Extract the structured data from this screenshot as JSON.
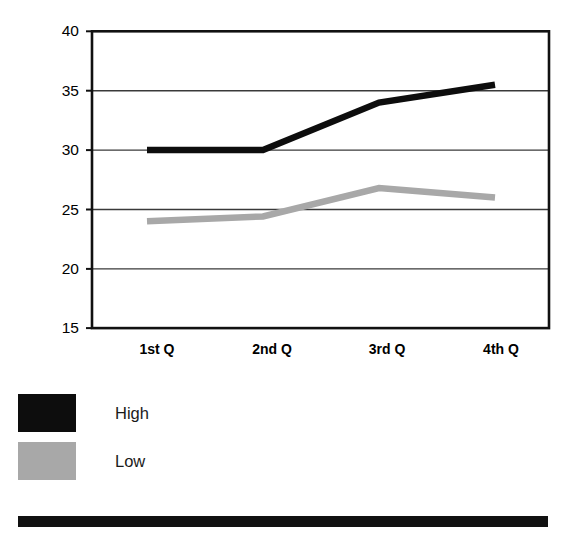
{
  "chart_data": {
    "type": "line",
    "title": "",
    "subtitle": "",
    "xlabel": "",
    "ylabel": "",
    "categories": [
      "1st Q",
      "2nd Q",
      "3rd Q",
      "4th Q"
    ],
    "series": [
      {
        "name": "High",
        "color": "#0d0d0d",
        "values": [
          30,
          30,
          34,
          35.5
        ]
      },
      {
        "name": "Low",
        "color": "#a8a8a8",
        "values": [
          24,
          24.4,
          26.8,
          26
        ]
      }
    ],
    "ylim": [
      15,
      40
    ],
    "yticks": [
      15,
      20,
      25,
      30,
      35,
      40
    ],
    "ytick_labels": [
      "15",
      "20",
      "25",
      "30",
      "35",
      "40"
    ],
    "xtick_labels": [
      "1st Q",
      "2nd Q",
      "3rd Q",
      "4th Q"
    ],
    "grid": "horizontal",
    "grid_color": "#3a3a3a",
    "legend_position": "below-left",
    "plot_border": true,
    "plot_border_color": "#111111"
  },
  "legend": {
    "items": [
      {
        "label": "High",
        "swatch_name": "legend-swatch-high"
      },
      {
        "label": "Low",
        "swatch_name": "legend-swatch-low"
      }
    ]
  },
  "axis": {
    "y_labels": [
      "40",
      "35",
      "30",
      "25",
      "20",
      "15"
    ],
    "x_labels": [
      "1st Q",
      "2nd Q",
      "3rd Q",
      "4th Q"
    ]
  },
  "colors": {
    "high_series": "#0d0d0d",
    "low_series": "#a8a8a8",
    "frame": "#111111",
    "gridline": "#3a3a3a",
    "background": "#ffffff",
    "rule": "#111111"
  }
}
